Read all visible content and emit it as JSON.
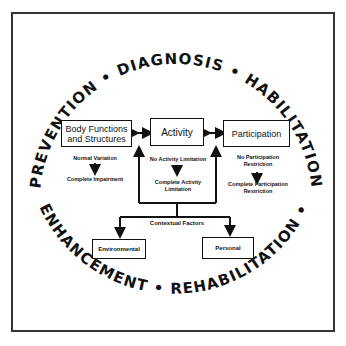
{
  "ring": {
    "top_words": [
      "Prevention",
      "Diagnosis",
      "Habilitation"
    ],
    "bottom_words": [
      "Enhancement",
      "Rehabilitation"
    ],
    "top_text": "PREVENTION • DIAGNOSIS • HABILITATION",
    "bottom_text": "ENHANCEMENT • REHABILITATION •"
  },
  "boxes": {
    "body": "Body Functions and Structures",
    "body_line1": "Body Functions",
    "body_line2": "and Structures",
    "activity": "Activity",
    "participation": "Participation",
    "environmental": "Environmental",
    "personal": "Personal"
  },
  "notes": {
    "body_top": "Normal Variation",
    "body_bottom": "Complete Impairment",
    "activity_top": "No Activity Limitation",
    "activity_bottom_1": "Complete Activity",
    "activity_bottom_2": "Limitation",
    "participation_top_1": "No Participation",
    "participation_top_2": "Restriction",
    "participation_bottom_1": "Complete Participation",
    "participation_bottom_2": "Restriction",
    "contextual": "Contextual Factors"
  }
}
